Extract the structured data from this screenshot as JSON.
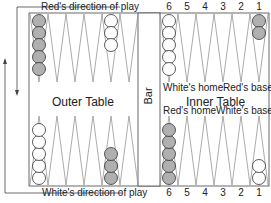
{
  "labels": {
    "red_direction": "Red's direction of play",
    "white_direction": "White's direction of play",
    "outer_table": "Outer Table",
    "inner_table": "Inner Table",
    "bar": "Bar",
    "white_home_top": "White's home",
    "red_base_top": "Red's base",
    "red_home_bottom": "Red's home",
    "white_base_bottom": "White's base"
  },
  "point_numbers_top": [
    "6",
    "5",
    "4",
    "3",
    "2",
    "1"
  ],
  "point_numbers_bottom": [
    "6",
    "5",
    "4",
    "3",
    "2",
    "1"
  ],
  "colors": {
    "red_checker": "#b0b0b0",
    "white_checker": "#ffffff",
    "line": "#555555"
  },
  "checkers": {
    "top_outer_point_1": {
      "color": "red",
      "count": 5
    },
    "top_outer_point_5": {
      "color": "white",
      "count": 3
    },
    "top_inner_point_6": {
      "color": "white",
      "count": 5
    },
    "top_inner_point_1": {
      "color": "red",
      "count": 2
    },
    "bottom_outer_point_1": {
      "color": "white",
      "count": 5
    },
    "bottom_outer_point_5": {
      "color": "red",
      "count": 3
    },
    "bottom_inner_point_6": {
      "color": "red",
      "count": 5
    },
    "bottom_inner_point_1": {
      "color": "white",
      "count": 2
    }
  }
}
